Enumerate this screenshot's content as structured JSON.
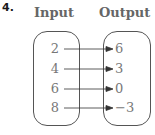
{
  "problem_number": "4.",
  "headers": {
    "input": "Input",
    "output": "Output"
  },
  "mapping": [
    {
      "input": "2",
      "output": "6"
    },
    {
      "input": "4",
      "output": "3"
    },
    {
      "input": "6",
      "output": "0"
    },
    {
      "input": "8",
      "output": "−3"
    }
  ],
  "colors": {
    "text": "#777777",
    "border": "#555555",
    "arrow": "#333333"
  }
}
